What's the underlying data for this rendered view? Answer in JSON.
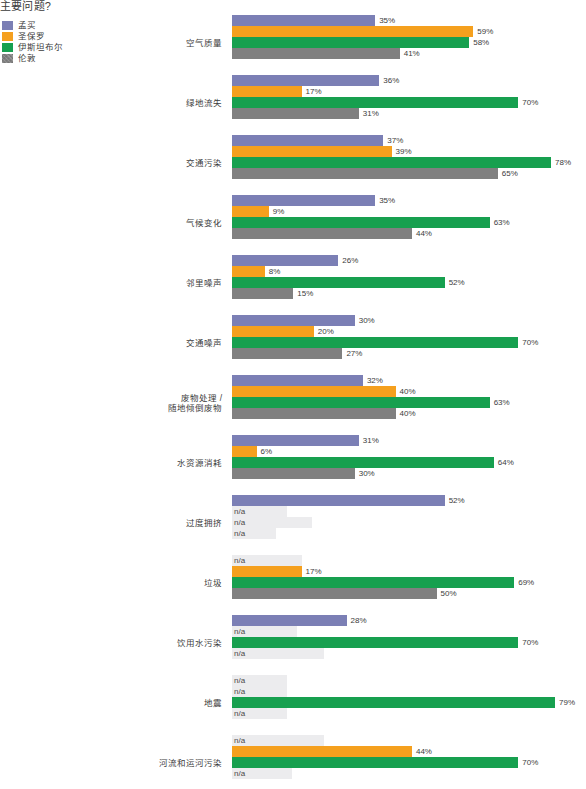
{
  "title": "主要问题?",
  "legend": {
    "position": "top-left",
    "items": [
      {
        "label": "孟买",
        "color": "#7b7fb5"
      },
      {
        "label": "圣保罗",
        "color": "#f5a01e"
      },
      {
        "label": "伊斯坦布尔",
        "color": "#17a04f"
      },
      {
        "label": "伦敦",
        "color": "#808080"
      }
    ]
  },
  "axis": {
    "px_per_percent": 4.09,
    "na_text": "n/a"
  },
  "chart_data": {
    "type": "bar",
    "orientation": "horizontal",
    "title": "主要问题?",
    "xlabel": "",
    "ylabel": "",
    "xlim": [
      0,
      80
    ],
    "grid": false,
    "legend_position": "top-left",
    "value_suffix": "%",
    "missing_label": "n/a",
    "categories": [
      "空气质量",
      "绿地流失",
      "交通污染",
      "气候变化",
      "邻里噪声",
      "交通噪声",
      "废物处理 /\n随地倾倒废物",
      "水资源消耗",
      "过度拥挤",
      "垃圾",
      "饮用水污染",
      "地震",
      "河流和运河污染"
    ],
    "series": [
      {
        "name": "孟买",
        "color": "#7b7fb5",
        "values": [
          35,
          36,
          37,
          35,
          26,
          30,
          32,
          31,
          52,
          null,
          28,
          null,
          null
        ],
        "na_placeholder_px": [
          0,
          0,
          0,
          0,
          0,
          0,
          0,
          0,
          0,
          70,
          0,
          55,
          92
        ]
      },
      {
        "name": "圣保罗",
        "color": "#f5a01e",
        "values": [
          59,
          17,
          39,
          9,
          8,
          20,
          40,
          6,
          null,
          17,
          null,
          null,
          44
        ],
        "na_placeholder_px": [
          0,
          0,
          0,
          0,
          0,
          0,
          0,
          0,
          55,
          0,
          65,
          55,
          0
        ]
      },
      {
        "name": "伊斯坦布尔",
        "color": "#17a04f",
        "values": [
          58,
          70,
          78,
          63,
          52,
          70,
          63,
          64,
          null,
          69,
          70,
          79,
          70
        ],
        "na_placeholder_px": [
          0,
          0,
          0,
          0,
          0,
          0,
          0,
          0,
          80,
          0,
          0,
          0,
          0
        ]
      },
      {
        "name": "伦敦",
        "color": "#808080",
        "hatched": true,
        "values": [
          41,
          31,
          65,
          44,
          15,
          27,
          40,
          30,
          null,
          50,
          null,
          null,
          null
        ],
        "na_placeholder_px": [
          0,
          0,
          0,
          0,
          0,
          0,
          0,
          0,
          44,
          0,
          92,
          55,
          0
        ]
      }
    ]
  }
}
